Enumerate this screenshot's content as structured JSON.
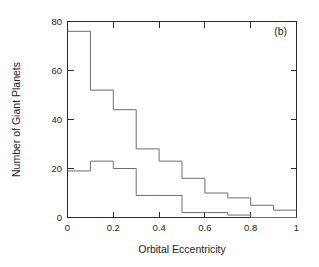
{
  "chart_data": {
    "type": "bar",
    "title": "",
    "panel_label": "(b)",
    "xlabel": "Orbital Eccentricity",
    "ylabel": "Number of Giant Planets",
    "xlim": [
      0,
      1
    ],
    "ylim": [
      0,
      80
    ],
    "grid": false,
    "legend": null,
    "bin_width": 0.1,
    "bin_edges": [
      0.0,
      0.1,
      0.2,
      0.3,
      0.4,
      0.5,
      0.6,
      0.7,
      0.8,
      0.9,
      1.0
    ],
    "categories": [
      "0.0-0.1",
      "0.1-0.2",
      "0.2-0.3",
      "0.3-0.4",
      "0.4-0.5",
      "0.5-0.6",
      "0.6-0.7",
      "0.7-0.8",
      "0.8-0.9",
      "0.9-1.0"
    ],
    "series": [
      {
        "name": "upper-histogram",
        "values": [
          76,
          52,
          44,
          28,
          23,
          16,
          10,
          8,
          5,
          3
        ],
        "color": "#6d6d6d"
      },
      {
        "name": "lower-histogram",
        "values": [
          19,
          23,
          20,
          9,
          9,
          2,
          2,
          1,
          0,
          0
        ],
        "color": "#6d6d6d"
      }
    ],
    "xticks": [
      {
        "value": 0,
        "label": "0"
      },
      {
        "value": 0.2,
        "label": "0.2"
      },
      {
        "value": 0.4,
        "label": "0.4"
      },
      {
        "value": 0.6,
        "label": "0.6"
      },
      {
        "value": 0.8,
        "label": "0.8"
      },
      {
        "value": 1,
        "label": "1"
      }
    ],
    "yticks": [
      {
        "value": 0,
        "label": "0"
      },
      {
        "value": 20,
        "label": "20"
      },
      {
        "value": 40,
        "label": "40"
      },
      {
        "value": 60,
        "label": "60"
      },
      {
        "value": 80,
        "label": "80"
      }
    ]
  }
}
